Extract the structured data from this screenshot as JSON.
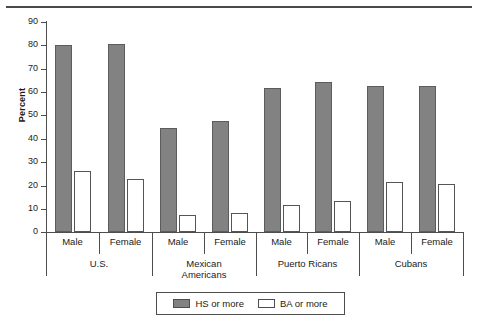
{
  "chart_data": {
    "type": "bar",
    "title": "",
    "subtitle": "",
    "xlabel": "",
    "ylabel": "Percent",
    "ylim": [
      0,
      90
    ],
    "yticks": [
      0,
      10,
      20,
      30,
      40,
      50,
      60,
      70,
      80,
      90
    ],
    "grid": false,
    "legend_position": "bottom-center",
    "groups": [
      "U.S.",
      "Mexican\nAmericans",
      "Puerto Ricans",
      "Cubans"
    ],
    "subcategories": [
      "Male",
      "Female"
    ],
    "categories": [
      "U.S. Male",
      "U.S. Female",
      "Mexican Americans Male",
      "Mexican Americans Female",
      "Puerto Ricans Male",
      "Puerto Ricans Female",
      "Cubans Male",
      "Cubans Female"
    ],
    "series": [
      {
        "name": "HS or more",
        "color": "#828282",
        "values": [
          80.0,
          80.8,
          44.5,
          47.4,
          61.8,
          64.4,
          62.7,
          62.7
        ]
      },
      {
        "name": "BA or more",
        "color": "#ffffff",
        "values": [
          26.2,
          22.9,
          7.4,
          8.1,
          11.6,
          13.3,
          21.5,
          20.7
        ]
      }
    ]
  },
  "axis": {
    "y_label": "Percent",
    "y_tick_labels": [
      "90",
      "80",
      "70",
      "60",
      "50",
      "40",
      "30",
      "20",
      "10",
      "0"
    ]
  },
  "x_axis": {
    "sub_labels": [
      "Male",
      "Female",
      "Male",
      "Female",
      "Male",
      "Female",
      "Male",
      "Female"
    ],
    "group_labels": [
      "U.S.",
      "Mexican\nAmericans",
      "Puerto Ricans",
      "Cubans"
    ]
  },
  "legend": {
    "entries": [
      {
        "label": "HS or more",
        "swatch": "filled-gray-swatch"
      },
      {
        "label": "BA or more",
        "swatch": "hollow-white-swatch"
      }
    ]
  }
}
